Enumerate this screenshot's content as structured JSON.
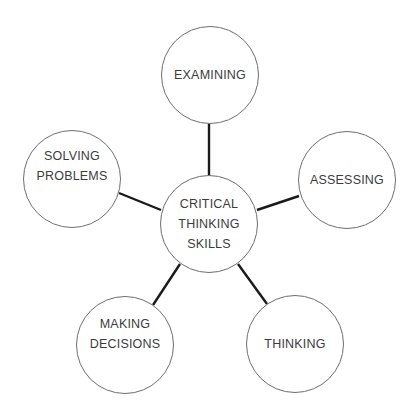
{
  "diagram": {
    "type": "mind-map",
    "center": {
      "label_lines": [
        "CRITICAL",
        "THINKING",
        "SKILLS"
      ],
      "cx": 209,
      "cy": 224,
      "r": 49
    },
    "nodes": [
      {
        "id": "examining",
        "label_lines": [
          "EXAMINING"
        ],
        "cx": 210,
        "cy": 75,
        "r": 49
      },
      {
        "id": "assessing",
        "label_lines": [
          "ASSESSING"
        ],
        "cx": 347,
        "cy": 180,
        "r": 49
      },
      {
        "id": "thinking",
        "label_lines": [
          "THINKING"
        ],
        "cx": 295,
        "cy": 344,
        "r": 49
      },
      {
        "id": "making-decisions",
        "label_lines": [
          "MAKING",
          "DECISIONS"
        ],
        "cx": 125,
        "cy": 345,
        "r": 49
      },
      {
        "id": "solving-problems",
        "label_lines": [
          "SOLVING",
          "PROBLEMS"
        ],
        "cx": 72,
        "cy": 179,
        "r": 49
      }
    ],
    "colors": {
      "line": "#1a1a1a",
      "circle_border": "#6e6e6e",
      "text": "#3c3c3c",
      "background": "#ffffff"
    }
  }
}
